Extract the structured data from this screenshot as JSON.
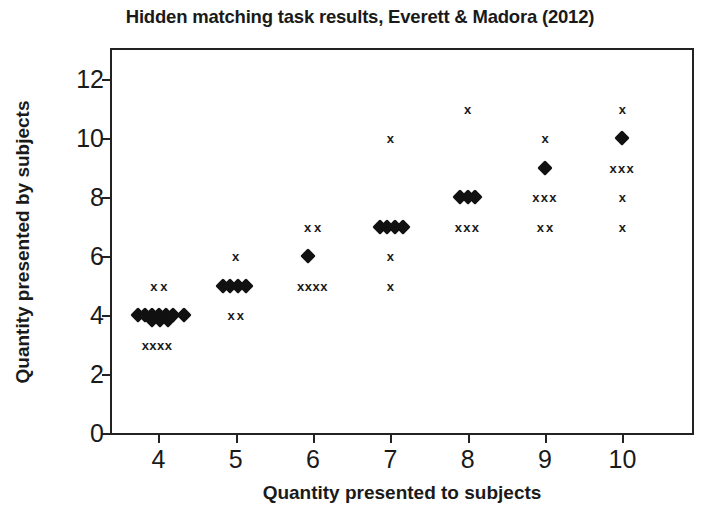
{
  "chart_data": {
    "type": "scatter",
    "title": "Hidden matching task results, Everett & Madora (2012)",
    "xlabel": "Quantity presented to subjects",
    "ylabel": "Quantity presented by subjects",
    "xlim": [
      3.4,
      10.9
    ],
    "ylim": [
      0,
      13
    ],
    "xticks": [
      4,
      5,
      6,
      7,
      8,
      9,
      10
    ],
    "yticks": [
      0,
      2,
      4,
      6,
      8,
      10,
      12
    ],
    "xtick_labels": [
      "4",
      "5",
      "6",
      "7",
      "8",
      "9",
      "10"
    ],
    "ytick_labels": [
      "0",
      "2",
      "4",
      "6",
      "8",
      "10",
      "12"
    ],
    "grid": false,
    "legend": "none",
    "marker_color": "#111111",
    "axis_color": "#222222",
    "series": [
      {
        "name": "diamond-markers",
        "marker": "diamond",
        "points": [
          {
            "x": 3.74,
            "y": 4.0
          },
          {
            "x": 3.83,
            "y": 4.0
          },
          {
            "x": 3.92,
            "y": 4.0
          },
          {
            "x": 4.01,
            "y": 4.0
          },
          {
            "x": 4.1,
            "y": 4.0
          },
          {
            "x": 4.19,
            "y": 4.0
          },
          {
            "x": 4.33,
            "y": 4.0
          },
          {
            "x": 3.92,
            "y": 3.83
          },
          {
            "x": 4.02,
            "y": 3.83
          },
          {
            "x": 4.12,
            "y": 3.83
          },
          {
            "x": 4.83,
            "y": 5.0
          },
          {
            "x": 4.93,
            "y": 5.0
          },
          {
            "x": 5.03,
            "y": 5.0
          },
          {
            "x": 5.13,
            "y": 5.0
          },
          {
            "x": 5.94,
            "y": 6.0
          },
          {
            "x": 6.86,
            "y": 7.0
          },
          {
            "x": 6.96,
            "y": 7.0
          },
          {
            "x": 7.06,
            "y": 7.0
          },
          {
            "x": 7.16,
            "y": 7.0
          },
          {
            "x": 7.9,
            "y": 8.0
          },
          {
            "x": 8.0,
            "y": 8.0
          },
          {
            "x": 8.1,
            "y": 8.0
          },
          {
            "x": 9.0,
            "y": 9.0
          },
          {
            "x": 10.0,
            "y": 10.0
          }
        ]
      },
      {
        "name": "cross-markers",
        "marker": "x",
        "points": [
          {
            "x": 3.94,
            "y": 5.0
          },
          {
            "x": 4.07,
            "y": 5.0
          },
          {
            "x": 3.83,
            "y": 3.0
          },
          {
            "x": 3.93,
            "y": 3.0
          },
          {
            "x": 4.03,
            "y": 3.0
          },
          {
            "x": 4.13,
            "y": 3.0
          },
          {
            "x": 5.0,
            "y": 6.0
          },
          {
            "x": 4.94,
            "y": 4.0
          },
          {
            "x": 5.06,
            "y": 4.0
          },
          {
            "x": 5.93,
            "y": 7.0
          },
          {
            "x": 6.06,
            "y": 7.0
          },
          {
            "x": 5.84,
            "y": 5.0
          },
          {
            "x": 5.94,
            "y": 5.0
          },
          {
            "x": 6.04,
            "y": 5.0
          },
          {
            "x": 6.14,
            "y": 5.0
          },
          {
            "x": 7.0,
            "y": 10.0
          },
          {
            "x": 7.0,
            "y": 6.0
          },
          {
            "x": 7.0,
            "y": 5.0
          },
          {
            "x": 8.0,
            "y": 11.0
          },
          {
            "x": 7.88,
            "y": 7.0
          },
          {
            "x": 7.99,
            "y": 7.0
          },
          {
            "x": 8.1,
            "y": 7.0
          },
          {
            "x": 9.0,
            "y": 10.0
          },
          {
            "x": 8.88,
            "y": 8.0
          },
          {
            "x": 8.99,
            "y": 8.0
          },
          {
            "x": 9.1,
            "y": 8.0
          },
          {
            "x": 8.94,
            "y": 7.0
          },
          {
            "x": 9.06,
            "y": 7.0
          },
          {
            "x": 10.0,
            "y": 11.0
          },
          {
            "x": 9.88,
            "y": 9.0
          },
          {
            "x": 9.99,
            "y": 9.0
          },
          {
            "x": 10.1,
            "y": 9.0
          },
          {
            "x": 10.0,
            "y": 8.0
          },
          {
            "x": 10.0,
            "y": 7.0
          }
        ]
      }
    ]
  }
}
